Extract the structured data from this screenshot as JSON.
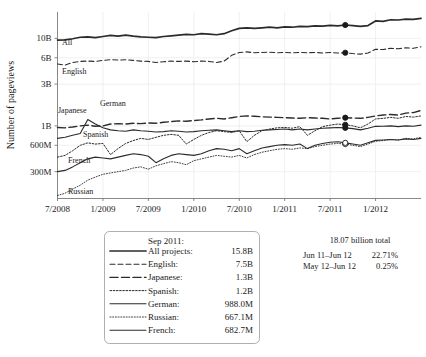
{
  "chart_data": {
    "type": "line",
    "title": "",
    "xlabel": "",
    "ylabel": "Number of pageviews",
    "yscale": "log",
    "ylim": [
      150000000,
      20000000000
    ],
    "ytick_labels": [
      "10B",
      "6B",
      "3B",
      "1B",
      "600M",
      "300M"
    ],
    "ytick_values": [
      10000000000,
      6000000000,
      3000000000,
      1000000000,
      600000000,
      300000000
    ],
    "xtick_labels": [
      "7/2008",
      "1/2009",
      "7/2009",
      "1/2010",
      "7/2010",
      "1/2011",
      "7/2011",
      "1/2012"
    ],
    "xlim": [
      "7/2008",
      "6/2012"
    ],
    "grid": true,
    "legend_position": "below-chart",
    "marker_month": "Sep 2011",
    "series": [
      {
        "name": "All projects",
        "style": "solid-thick",
        "inline_label": "All",
        "sep2011_value": "15.8B",
        "values": [
          9.55,
          9.6,
          9.9,
          10.3,
          10.4,
          10.2,
          10.5,
          10.8,
          10.6,
          10.9,
          10.6,
          10.4,
          10.3,
          10.2,
          10.5,
          10.7,
          10.9,
          11.1,
          11.0,
          11.3,
          11.2,
          11.0,
          11.3,
          12.2,
          13.0,
          13.2,
          13.0,
          13.2,
          13.4,
          13.2,
          13.5,
          13.4,
          13.7,
          13.6,
          13.9,
          13.8,
          14.1,
          13.9,
          14.2,
          14.0,
          13.7,
          14.0,
          15.8,
          15.6,
          16.3,
          16.2,
          16.6,
          16.5,
          16.9
        ]
      },
      {
        "name": "English",
        "style": "dashed",
        "inline_label": "English",
        "sep2011_value": "7.5B",
        "values": [
          5.1,
          4.95,
          5.3,
          5.45,
          5.5,
          5.45,
          5.6,
          5.7,
          5.65,
          5.7,
          5.6,
          5.5,
          5.45,
          5.3,
          5.4,
          5.5,
          5.45,
          5.5,
          5.4,
          5.5,
          5.45,
          5.3,
          5.5,
          6.4,
          6.9,
          7.0,
          6.85,
          6.9,
          6.95,
          6.85,
          6.9,
          6.85,
          6.9,
          6.85,
          6.9,
          6.8,
          6.9,
          6.8,
          6.85,
          6.7,
          6.6,
          6.8,
          7.5,
          7.45,
          7.7,
          7.6,
          7.8,
          7.7,
          8.0
        ]
      },
      {
        "name": "Japanese",
        "style": "long-dash",
        "inline_label": "Japanese",
        "sep2011_value": "1.3B",
        "values": [
          0.96,
          0.95,
          0.97,
          1.0,
          1.02,
          0.99,
          1.0,
          1.05,
          1.06,
          1.05,
          1.07,
          1.06,
          1.08,
          1.07,
          1.1,
          1.12,
          1.14,
          1.13,
          1.15,
          1.17,
          1.2,
          1.22,
          1.2,
          1.24,
          1.28,
          1.3,
          1.29,
          1.27,
          1.26,
          1.25,
          1.24,
          1.23,
          1.22,
          1.24,
          1.23,
          1.22,
          1.2,
          1.22,
          1.24,
          1.23,
          1.22,
          1.25,
          1.3,
          1.33,
          1.35,
          1.33,
          1.4,
          1.42,
          1.5
        ]
      },
      {
        "name": "Spanish",
        "style": "dotted",
        "inline_label": "Spanish",
        "sep2011_value": "1.2B",
        "values": [
          0.44,
          0.46,
          0.52,
          0.6,
          0.64,
          0.62,
          0.63,
          0.47,
          0.55,
          0.63,
          0.68,
          0.72,
          0.7,
          0.74,
          0.78,
          0.8,
          0.78,
          0.62,
          0.7,
          0.78,
          0.84,
          0.88,
          0.86,
          0.84,
          0.88,
          0.66,
          0.78,
          0.88,
          0.92,
          0.95,
          0.96,
          0.94,
          0.98,
          0.78,
          0.88,
          0.98,
          1.02,
          1.05,
          1.03,
          1.0,
          0.95,
          1.05,
          1.2,
          1.22,
          1.25,
          1.22,
          1.28,
          1.26,
          1.3
        ]
      },
      {
        "name": "German",
        "style": "solid",
        "inline_label": "German",
        "sep2011_value": "988.0M",
        "values": [
          0.72,
          0.74,
          0.78,
          0.82,
          1.18,
          1.05,
          0.95,
          0.9,
          0.88,
          0.87,
          0.9,
          0.88,
          0.87,
          0.85,
          0.86,
          0.88,
          0.87,
          0.85,
          0.86,
          0.88,
          0.89,
          0.9,
          0.88,
          0.86,
          0.88,
          0.86,
          0.87,
          0.89,
          0.9,
          0.91,
          0.92,
          0.9,
          0.92,
          0.9,
          0.92,
          0.94,
          0.95,
          0.96,
          0.95,
          0.93,
          0.9,
          0.94,
          0.988,
          0.99,
          1.0,
          0.98,
          1.0,
          0.99,
          1.02
        ]
      },
      {
        "name": "Russian",
        "style": "fine-dotted",
        "inline_label": "Russian",
        "sep2011_value": "667.1M",
        "values": [
          0.16,
          0.17,
          0.19,
          0.21,
          0.24,
          0.26,
          0.28,
          0.29,
          0.3,
          0.31,
          0.33,
          0.34,
          0.32,
          0.35,
          0.37,
          0.39,
          0.38,
          0.36,
          0.4,
          0.42,
          0.44,
          0.46,
          0.45,
          0.44,
          0.46,
          0.43,
          0.47,
          0.5,
          0.52,
          0.54,
          0.55,
          0.54,
          0.56,
          0.55,
          0.58,
          0.6,
          0.62,
          0.63,
          0.62,
          0.6,
          0.58,
          0.62,
          0.667,
          0.68,
          0.7,
          0.69,
          0.72,
          0.71,
          0.74
        ]
      },
      {
        "name": "French",
        "style": "solid",
        "inline_label": "French",
        "sep2011_value": "682.7M",
        "values": [
          0.3,
          0.31,
          0.34,
          0.38,
          0.42,
          0.44,
          0.43,
          0.42,
          0.44,
          0.46,
          0.48,
          0.47,
          0.45,
          0.38,
          0.42,
          0.46,
          0.48,
          0.47,
          0.46,
          0.48,
          0.52,
          0.55,
          0.54,
          0.52,
          0.55,
          0.48,
          0.52,
          0.56,
          0.58,
          0.6,
          0.61,
          0.6,
          0.62,
          0.55,
          0.6,
          0.63,
          0.65,
          0.66,
          0.64,
          0.62,
          0.6,
          0.64,
          0.683,
          0.69,
          0.7,
          0.69,
          0.71,
          0.7,
          0.72
        ]
      }
    ]
  },
  "legend": {
    "header": "Sep 2011:",
    "rows": [
      {
        "label": "All projects:",
        "value": "15.8B"
      },
      {
        "label": "English:",
        "value": "7.5B"
      },
      {
        "label": "Japanese:",
        "value": "1.3B"
      },
      {
        "label": "Spanish:",
        "value": "1.2B"
      },
      {
        "label": "German:",
        "value": "988.0M"
      },
      {
        "label": "Russian:",
        "value": "667.1M"
      },
      {
        "label": "French:",
        "value": "682.7M"
      }
    ]
  },
  "notes": {
    "total": "18.07 billion total",
    "rows": [
      {
        "period": "Jun 11–Jun 12",
        "change": "22.71%"
      },
      {
        "period": "May 12–Jun 12",
        "change": "0.25%"
      }
    ]
  },
  "axis": {
    "y_title": "Number of pageviews",
    "y_ticks": [
      "10B",
      "6B",
      "3B",
      "1B",
      "600M",
      "300M"
    ],
    "x_ticks": [
      "7/2008",
      "1/2009",
      "7/2009",
      "1/2010",
      "7/2010",
      "1/2011",
      "7/2011",
      "1/2012"
    ]
  },
  "inline_labels": {
    "all": "All",
    "english": "English",
    "japanese": "Japanese",
    "german": "German",
    "spanish": "Spanish",
    "french": "French",
    "russian": "Russian"
  },
  "colors": {
    "line": "#2b2b2b",
    "grid": "#e9e9ee",
    "axis": "#7a7a7a",
    "background": "#ffffff"
  }
}
